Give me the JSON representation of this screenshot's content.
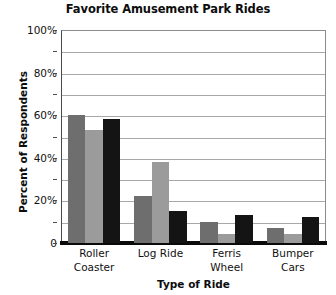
{
  "chart_data": {
    "type": "bar",
    "title": "Favorite Amusement Park Rides",
    "xlabel": "Type of Ride",
    "ylabel": "Percent of Respondents",
    "categories": [
      "Roller Coaster",
      "Log Ride",
      "Ferris Wheel",
      "Bumper Cars"
    ],
    "category_lines": [
      [
        "Roller",
        "Coaster"
      ],
      [
        "Log Ride"
      ],
      [
        "Ferris",
        "Wheel"
      ],
      [
        "Bumper",
        "Cars"
      ]
    ],
    "series": [
      {
        "name": "Series 1",
        "color": "#6e6e6e",
        "values": [
          60,
          22,
          10,
          7
        ]
      },
      {
        "name": "Series 2",
        "color": "#9b9b9b",
        "values": [
          53,
          38,
          4,
          4
        ]
      },
      {
        "name": "Series 3",
        "color": "#141414",
        "values": [
          58,
          15,
          13,
          12
        ]
      }
    ],
    "ylim": [
      0,
      100
    ],
    "ytick_values": [
      0,
      20,
      40,
      60,
      80,
      100
    ],
    "ytick_labels": [
      "0",
      "20%",
      "40%",
      "60%",
      "80%",
      "100%"
    ],
    "gridline_values": [
      10,
      20,
      30,
      40,
      50,
      60,
      70,
      80,
      90,
      100
    ],
    "grid": true,
    "legend": "none",
    "unit": "%"
  }
}
